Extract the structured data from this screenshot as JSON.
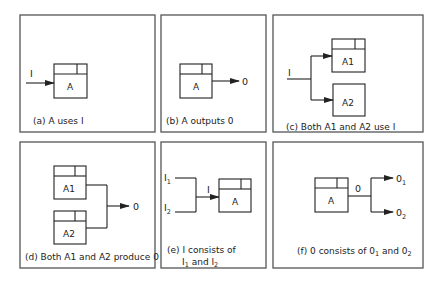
{
  "figure": {
    "panels": [
      {
        "id": "a",
        "caption": "(a) A uses I",
        "boxes": [
          "A"
        ],
        "inputs": [
          "I"
        ],
        "outputs": []
      },
      {
        "id": "b",
        "caption": "(b) A outputs 0",
        "boxes": [
          "A"
        ],
        "inputs": [],
        "outputs": [
          "0"
        ]
      },
      {
        "id": "c",
        "caption": "(c) Both A1 and A2 use I",
        "boxes": [
          "A1",
          "A2"
        ],
        "inputs": [
          "I"
        ],
        "outputs": []
      },
      {
        "id": "d",
        "caption": "(d) Both A1 and A2 produce 0",
        "boxes": [
          "A1",
          "A2"
        ],
        "inputs": [],
        "outputs": [
          "0"
        ]
      },
      {
        "id": "e",
        "caption_line1": "(e) I consists of",
        "caption_line2_parts": [
          "I",
          "1",
          " and ",
          "I",
          "2"
        ],
        "boxes": [
          "A"
        ],
        "inputs": [
          "I1",
          "I2"
        ],
        "merged": "I"
      },
      {
        "id": "f",
        "caption_parts": [
          "(f) 0 consists of ",
          "0",
          "1",
          " and ",
          "0",
          "2"
        ],
        "boxes": [
          "A"
        ],
        "outputs": [
          "O1",
          "O2"
        ],
        "merged": "0"
      }
    ],
    "labels": {
      "A": "A",
      "A1": "A1",
      "A2": "A2",
      "I": "I",
      "O": "0",
      "I_base": "I",
      "O_base": "0",
      "sub1": "1",
      "sub2": "2"
    }
  }
}
